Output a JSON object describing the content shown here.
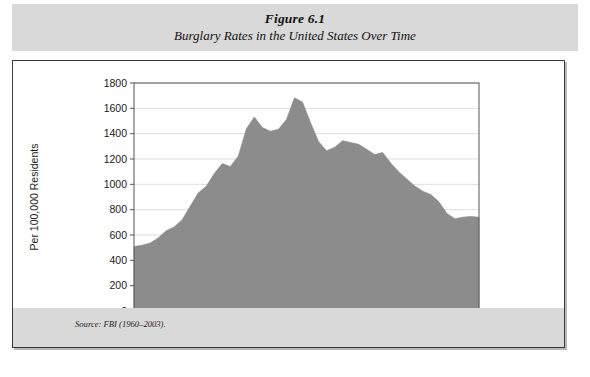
{
  "figure": {
    "number": "Figure 6.1",
    "caption": "Burglary Rates in the United States Over Time",
    "source": "Source: FBI (1960–2003)."
  },
  "colors": {
    "title_band": "#d9d9d9",
    "source_band": "#d9d9d9",
    "area_fill": "#8c8c8c",
    "frame_border": "#3a3a3a",
    "gridline": "#d5d5d5",
    "axis": "#555555",
    "text": "#1a1a1a"
  },
  "chart_data": {
    "type": "area",
    "title": "Burglary Rates in the United States Over Time",
    "subtitle": "Figure 6.1",
    "xlabel": "",
    "ylabel": "Per 100,000 Residents",
    "source": "Source: FBI (1960–2003).",
    "grid": true,
    "legend": "none",
    "xlim": [
      1960,
      2003
    ],
    "ylim": [
      0,
      1800
    ],
    "ytick_labels": [
      "0",
      "200",
      "400",
      "600",
      "800",
      "1000",
      "1200",
      "1400",
      "1600",
      "1800"
    ],
    "yticks": [
      0,
      200,
      400,
      600,
      800,
      1000,
      1200,
      1400,
      1600,
      1800
    ],
    "xtick_labels": [
      "1960",
      "1965",
      "1970",
      "1975",
      "1980",
      "1985",
      "1990",
      "1995",
      "2003"
    ],
    "xticks": [
      1960,
      1965,
      1970,
      1975,
      1980,
      1985,
      1990,
      1995,
      2003
    ],
    "series": [
      {
        "name": "Burglary rate per 100,000 residents",
        "x": [
          1960,
          1961,
          1962,
          1963,
          1964,
          1965,
          1966,
          1967,
          1968,
          1969,
          1970,
          1971,
          1972,
          1973,
          1974,
          1975,
          1976,
          1977,
          1978,
          1979,
          1980,
          1981,
          1982,
          1983,
          1984,
          1985,
          1986,
          1987,
          1988,
          1989,
          1990,
          1991,
          1992,
          1993,
          1994,
          1995,
          1996,
          1997,
          1998,
          1999,
          2000,
          2001,
          2002,
          2003
        ],
        "values": [
          509,
          519,
          536,
          576,
          634,
          663,
          721,
          827,
          932,
          984,
          1085,
          1164,
          1141,
          1223,
          1438,
          1532,
          1448,
          1420,
          1435,
          1512,
          1684,
          1650,
          1489,
          1338,
          1265,
          1292,
          1345,
          1330,
          1316,
          1276,
          1236,
          1252,
          1168,
          1100,
          1042,
          987,
          945,
          919,
          863,
          770,
          729,
          741,
          747,
          741
        ]
      }
    ]
  }
}
